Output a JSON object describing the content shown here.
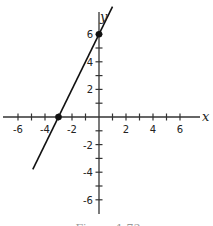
{
  "chart_data": {
    "type": "line",
    "title": "",
    "xlabel": "x",
    "ylabel": "y",
    "xlim": [
      -7.3,
      7.3
    ],
    "ylim": [
      -7,
      8.2
    ],
    "grid": false,
    "x_ticks": [
      -6,
      -5,
      -4,
      -3,
      -2,
      -1,
      1,
      2,
      3,
      4,
      5,
      6
    ],
    "y_ticks": [
      -6,
      -5,
      -4,
      -3,
      -2,
      -1,
      1,
      2,
      3,
      4,
      5,
      6
    ],
    "x_tick_labels": [
      "-6",
      "-4",
      "-2",
      "2",
      "4",
      "6"
    ],
    "x_tick_label_values": [
      -6,
      -4,
      -2,
      2,
      4,
      6
    ],
    "y_tick_labels": [
      "6",
      "4",
      "2",
      "-2",
      "-4",
      "-6"
    ],
    "y_tick_label_values": [
      6,
      4,
      2,
      -2,
      -4,
      -6
    ],
    "series": [
      {
        "name": "y = 2x + 6",
        "x": [
          -4.9,
          1.0
        ],
        "y": [
          -3.8,
          8.0
        ],
        "color": "#111111"
      }
    ],
    "points": [
      {
        "x": 0,
        "y": 6,
        "label": "y-intercept"
      },
      {
        "x": -3,
        "y": 0,
        "label": "x-intercept"
      }
    ],
    "caption": "Figure 1.73"
  }
}
